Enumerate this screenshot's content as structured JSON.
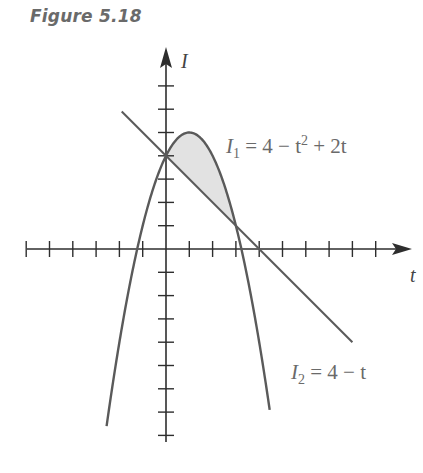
{
  "figure": {
    "title": "Figure 5.18"
  },
  "axes": {
    "x_label": "t",
    "y_label": "I",
    "origin_px": [
      166,
      249
    ],
    "unit_px": 23.3,
    "x_ticks": [
      -6,
      -5,
      -4,
      -3,
      -2,
      -1,
      1,
      2,
      3,
      4,
      5,
      6,
      7,
      8,
      9
    ],
    "y_ticks": [
      -8,
      -7,
      -6,
      -5,
      -4,
      -3,
      -2,
      -1,
      1,
      2,
      3,
      4,
      5,
      6,
      7
    ]
  },
  "curves": {
    "parabola": {
      "name": "I1",
      "label_main": "I",
      "label_sub": "1",
      "label_rest": " = 4 − t",
      "label_sup": "2",
      "label_tail": " + 2t",
      "equation": "I1 = 4 − t^2 + 2t",
      "t_range": [
        -2.55,
        4.45
      ]
    },
    "line": {
      "name": "I2",
      "label_main": "I",
      "label_sub": "2",
      "label_rest": " = 4 − t",
      "equation": "I2 = 4 − t",
      "t_range": [
        -1.9,
        8.0
      ]
    },
    "shaded_region": {
      "between": [
        "I1",
        "I2"
      ],
      "t_from": 0,
      "t_to": 3
    }
  },
  "colors": {
    "axis": "#2e2e2e",
    "curve": "#5a5a5a",
    "shade": "#e2e2e2",
    "label": "#6a6a6a"
  }
}
